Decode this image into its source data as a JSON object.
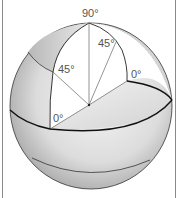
{
  "figure": {
    "labels": {
      "top": "90°",
      "left_mid": "45°",
      "right_mid": "45°",
      "left_base": "0°",
      "right_base": "0°"
    },
    "colors": {
      "sphere_light": "#f2f2f2",
      "sphere_dark": "#9a9a9a",
      "line": "#222222",
      "thin_line": "#666666",
      "cutaway": "#ffffff",
      "border": "#8a8a8a"
    }
  }
}
